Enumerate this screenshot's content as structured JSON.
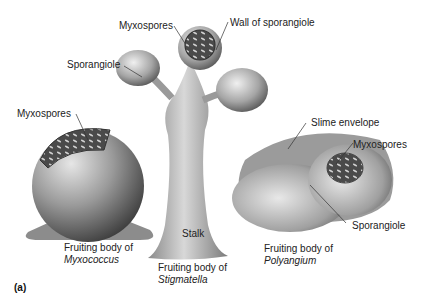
{
  "figure": {
    "panel_label": "(a)",
    "labels": {
      "myxospores_top": "Myxospores",
      "wall_of_sporangiole": "Wall of sporangiole",
      "sporangiole_left": "Sporangiole",
      "myxospores_left": "Myxospores",
      "slime_envelope": "Slime envelope",
      "myxospores_right": "Myxospores",
      "sporangiole_right": "Sporangiole",
      "stalk": "Stalk"
    },
    "captions": {
      "myxococcus_line1": "Fruiting body of",
      "myxococcus_line2": "Myxococcus",
      "stigmatella_line1": "Fruiting body of",
      "stigmatella_line2": "Stigmatella",
      "polyangium_line1": "Fruiting body of",
      "polyangium_line2": "Polyangium"
    }
  }
}
